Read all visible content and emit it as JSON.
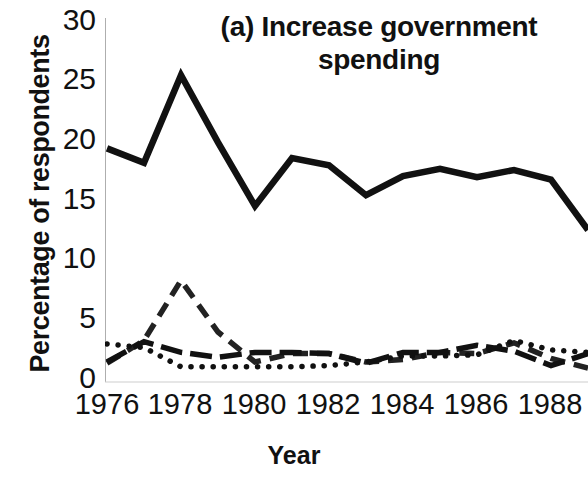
{
  "chart_data": {
    "type": "line",
    "title": "(a) Increase government spending",
    "title_line1": "(a) Increase government",
    "title_line2": "spending",
    "xlabel": "Year",
    "ylabel": "Percentage of respondents",
    "xlim": [
      1976,
      1989
    ],
    "ylim": [
      0,
      30
    ],
    "ytick_labels": [
      "30",
      "25",
      "20",
      "15",
      "10",
      "5",
      "0"
    ],
    "ytick_values": [
      30,
      25,
      20,
      15,
      10,
      5,
      0
    ],
    "xtick_labels": [
      "1976",
      "1978",
      "1980",
      "1982",
      "1984",
      "1986",
      "1988"
    ],
    "xtick_values": [
      1976,
      1978,
      1980,
      1982,
      1984,
      1986,
      1988
    ],
    "grid": false,
    "legend": "none",
    "x": [
      1976,
      1977,
      1978,
      1979,
      1980,
      1981,
      1982,
      1983,
      1984,
      1985,
      1986,
      1987,
      1988,
      1989
    ],
    "series": [
      {
        "name": "series-1",
        "style": "solid",
        "color": "#111111",
        "values": [
          19.3,
          18.1,
          25.4,
          19.8,
          14.5,
          18.5,
          17.9,
          15.4,
          17.0,
          17.6,
          16.9,
          17.5,
          16.7,
          12.5
        ]
      },
      {
        "name": "series-2",
        "style": "dashed",
        "color": "#222222",
        "values": [
          1.4,
          3.3,
          8.3,
          4.0,
          1.5,
          2.2,
          2.2,
          1.5,
          1.7,
          2.3,
          2.2,
          3.1,
          1.8,
          1.0
        ]
      },
      {
        "name": "series-3",
        "style": "dotted",
        "color": "#111111",
        "values": [
          3.0,
          2.7,
          1.1,
          1.1,
          1.1,
          1.1,
          1.2,
          1.5,
          2.0,
          2.0,
          2.1,
          3.3,
          2.5,
          2.3
        ]
      },
      {
        "name": "series-4",
        "style": "dashdot",
        "color": "#111111",
        "values": [
          1.5,
          3.2,
          2.3,
          1.9,
          2.3,
          2.3,
          2.2,
          1.4,
          2.3,
          2.3,
          2.9,
          2.4,
          1.2,
          2.2
        ]
      }
    ]
  }
}
